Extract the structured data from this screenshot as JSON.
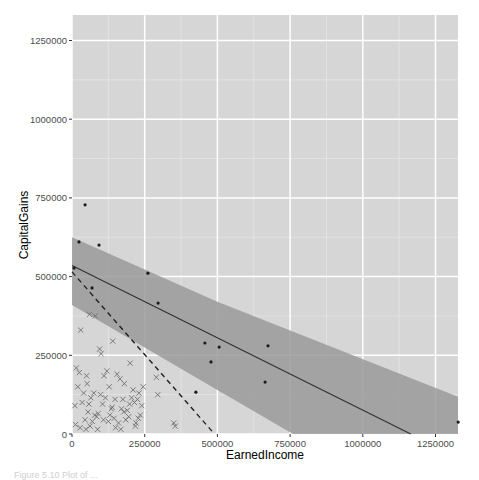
{
  "chart_data": {
    "type": "scatter",
    "title": "",
    "xlabel": "EarnedIncome",
    "ylabel": "CapitalGains",
    "xlim": [
      0,
      1330000
    ],
    "ylim": [
      0,
      1320000
    ],
    "x_ticks": [
      0,
      250000,
      500000,
      750000,
      1000000,
      1250000
    ],
    "x_tick_labels": [
      "0",
      "250000",
      "500000",
      "750000",
      "1000000",
      "1250000"
    ],
    "y_ticks": [
      0,
      250000,
      500000,
      750000,
      1000000,
      1250000
    ],
    "y_tick_labels": [
      "0",
      "250000",
      "500000",
      "750000",
      "1000000",
      "1250000"
    ],
    "grid": true,
    "legend": "none",
    "series": [
      {
        "name": "points",
        "marker": "dot",
        "x": [
          45000,
          24000,
          93000,
          7000,
          69000,
          261000,
          296000,
          457000,
          506000,
          478000,
          674000,
          664000,
          426000,
          1328000
        ],
        "y": [
          728000,
          610000,
          600000,
          527000,
          464000,
          511000,
          416000,
          289000,
          276000,
          229000,
          280000,
          165000,
          133000,
          38000
        ]
      },
      {
        "name": "crosses",
        "marker": "x",
        "x": [
          30000,
          60000,
          80000,
          15000,
          25000,
          50000,
          95000,
          100000,
          110000,
          120000,
          140000,
          155000,
          165000,
          180000,
          200000,
          205000,
          210000,
          215000,
          230000,
          245000,
          290000,
          295000,
          350000,
          355000,
          20000,
          35000,
          45000,
          55000,
          65000,
          75000,
          85000,
          105000,
          125000,
          130000,
          145000,
          160000,
          170000,
          185000,
          190000,
          225000,
          10000,
          40000,
          70000,
          90000,
          115000,
          135000,
          150000,
          175000,
          195000,
          220000,
          235000,
          240000,
          12000,
          28000,
          48000,
          52000,
          58000,
          62000,
          78000,
          88000,
          98000,
          108000,
          128000,
          138000,
          148000,
          168000,
          178000,
          198000,
          218000,
          228000
        ],
        "y": [
          330000,
          380000,
          375000,
          210000,
          195000,
          185000,
          270000,
          255000,
          185000,
          200000,
          295000,
          190000,
          175000,
          160000,
          225000,
          115000,
          140000,
          100000,
          130000,
          150000,
          180000,
          125000,
          35000,
          25000,
          150000,
          100000,
          45000,
          70000,
          115000,
          130000,
          55000,
          95000,
          40000,
          60000,
          50000,
          35000,
          80000,
          45000,
          75000,
          110000,
          90000,
          130000,
          40000,
          65000,
          115000,
          80000,
          20000,
          110000,
          55000,
          35000,
          60000,
          90000,
          30000,
          20000,
          15000,
          160000,
          95000,
          25000,
          60000,
          15000,
          125000,
          45000,
          150000,
          85000,
          110000,
          15000,
          70000,
          95000,
          25000,
          50000
        ]
      }
    ],
    "regression": {
      "line": [
        [
          0,
          535000
        ],
        [
          1165000,
          0
        ]
      ],
      "ribbon_upper": [
        [
          0,
          625000
        ],
        [
          500000,
          420000
        ],
        [
          1328000,
          118000
        ]
      ],
      "ribbon_lower": [
        [
          0,
          410000
        ],
        [
          500000,
          140000
        ],
        [
          760000,
          0
        ]
      ],
      "color": "#333333",
      "ribbon_color": "#999999"
    },
    "reference_line": {
      "style": "dashed",
      "points": [
        [
          0,
          515000
        ],
        [
          490000,
          0
        ]
      ]
    },
    "colors": {
      "panel_bg": "#d6d6d6",
      "grid_major": "#ffffff",
      "grid_minor": "#e6e6e6",
      "ribbon": "#9a9a9a",
      "point": "#1a1a1a",
      "cross": "#6e6e6e"
    }
  },
  "caption": "Figure 5.10  Plot of ..."
}
